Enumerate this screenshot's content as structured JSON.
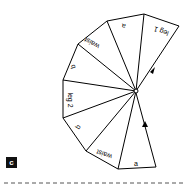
{
  "figure": {
    "panel_label": "c",
    "segments": [
      {
        "label": "leg 1"
      },
      {
        "label": "a"
      },
      {
        "label": "waist"
      },
      {
        "label": "b"
      },
      {
        "label": "leg 2"
      },
      {
        "label": "b"
      },
      {
        "label": "waist"
      },
      {
        "label": "a"
      }
    ],
    "colors": {
      "stroke": "#000000",
      "background": "#ffffff",
      "label_box": "#111111",
      "dash": "#555555"
    }
  }
}
